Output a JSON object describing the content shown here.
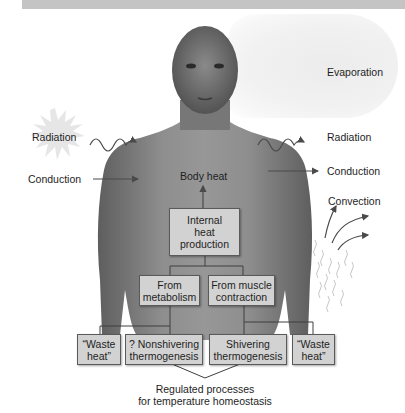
{
  "diagram": {
    "type": "heat exchange diagram",
    "labels": {
      "evaporation": "Evaporation",
      "radiation_in": "Radiation",
      "radiation_out": "Radiation",
      "conduction_in": "Conduction",
      "conduction_out": "Conduction",
      "convection": "Convection",
      "body_heat": "Body heat"
    },
    "boxes": {
      "internal_heat": [
        "Internal",
        "heat",
        "production"
      ],
      "from_metabolism": [
        "From",
        "metabolism"
      ],
      "from_muscle": [
        "From muscle",
        "contraction"
      ],
      "waste_heat_left": [
        "“Waste",
        "heat”"
      ],
      "nonshivering": [
        "? Nonshivering",
        "thermogenesis"
      ],
      "shivering": [
        "Shivering",
        "thermogenesis"
      ],
      "waste_heat_right": [
        "“Waste",
        "heat”"
      ]
    },
    "caption": [
      "Regulated processes",
      "for temperature homeostasis"
    ],
    "colors": {
      "box_fill": "#d2d2d2",
      "box_border": "#5a5a5a",
      "arrow": "#4a4a4a",
      "skin": "#8a8a8a"
    }
  }
}
